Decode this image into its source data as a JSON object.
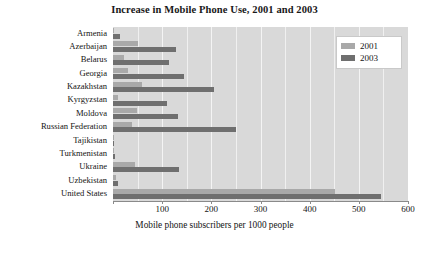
{
  "chart_data": {
    "type": "bar",
    "orientation": "horizontal",
    "title": "Increase in Mobile Phone Use, 2001 and 2003",
    "xlabel": "Mobile phone subscribers per 1000 people",
    "ylabel": "",
    "xlim": [
      0,
      600
    ],
    "xticks": [
      0,
      100,
      200,
      300,
      400,
      500,
      600
    ],
    "xticklabels": [
      "",
      "100",
      "200",
      "300",
      "400",
      "500",
      "600"
    ],
    "grid": true,
    "legend_position": "top-right",
    "categories": [
      "Armenia",
      "Azerbaijan",
      "Belarus",
      "Georgia",
      "Kazakhstan",
      "Kyrgyzstan",
      "Moldova",
      "Russian Federation",
      "Tajikistan",
      "Turkmenistan",
      "Ukraine",
      "Uzbekistan",
      "United States"
    ],
    "series": [
      {
        "name": "2001",
        "color": "#a9a9a9",
        "values": [
          3,
          50,
          22,
          30,
          58,
          10,
          48,
          38,
          1,
          2,
          44,
          6,
          452
        ]
      },
      {
        "name": "2003",
        "color": "#6f6f6f",
        "values": [
          15,
          129,
          113,
          145,
          205,
          109,
          132,
          250,
          3,
          5,
          135,
          10,
          545
        ]
      }
    ]
  },
  "legend": {
    "items": [
      {
        "label": "2001",
        "color": "#a9a9a9"
      },
      {
        "label": "2003",
        "color": "#6f6f6f"
      }
    ]
  },
  "colors": {
    "plot_background": "#d9d9d9",
    "gridline": "#f2f2f2",
    "axis": "#8a8a8a",
    "series_2001": "#a9a9a9",
    "series_2003": "#6f6f6f",
    "page_background": "#ffffff"
  }
}
